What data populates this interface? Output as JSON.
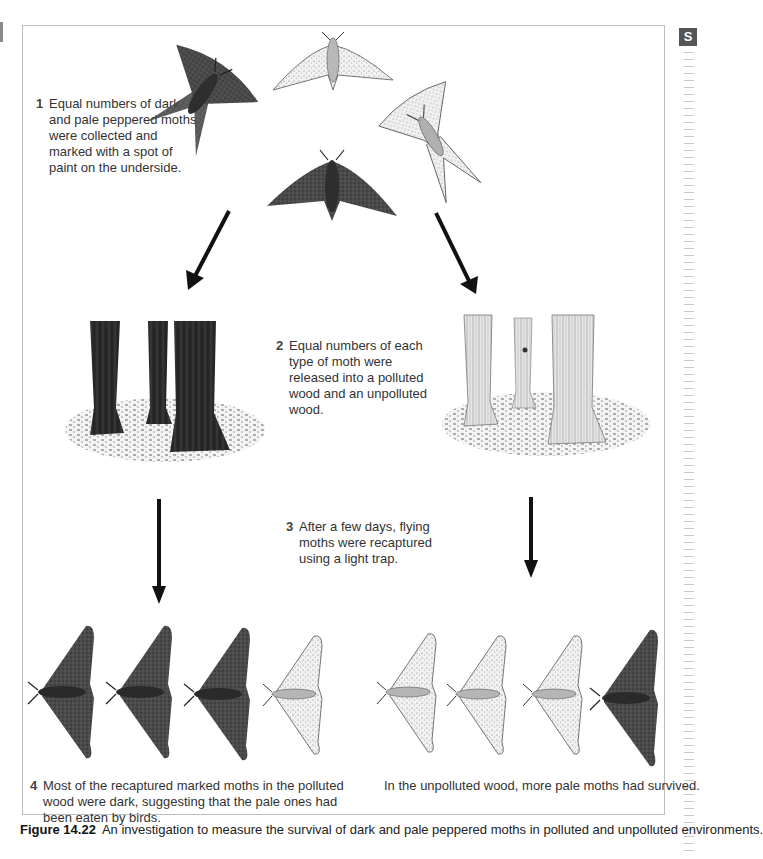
{
  "page": {
    "side_tab_letter": "S"
  },
  "figure": {
    "number": "Figure 14.22",
    "caption": "An investigation to measure the survival of dark and pale peppered moths in polluted and unpolluted environments.",
    "steps": [
      {
        "number": "1",
        "text_lines": [
          "Equal numbers of dark",
          "and pale peppered moths",
          "were collected and",
          "marked with a spot of",
          "paint on the underside."
        ]
      },
      {
        "number": "2",
        "text_lines": [
          "Equal numbers of each",
          "type of moth were",
          "released into a polluted",
          "wood and an unpolluted",
          "wood."
        ]
      },
      {
        "number": "3",
        "text_lines": [
          "After a few days, flying",
          "moths were recaptured",
          "using a light trap."
        ]
      },
      {
        "number": "4",
        "text_lines": [
          "Most of the recaptured marked moths in the polluted",
          "wood were dark, suggesting that the pale ones had",
          "been eaten by birds."
        ]
      }
    ],
    "unpolluted_result": "In the unpolluted wood, more pale moths had survived.",
    "illustrations": {
      "initial_moths": [
        "dark",
        "pale",
        "pale",
        "dark"
      ],
      "polluted_wood": "dark-tree-trunks",
      "unpolluted_wood": "pale-tree-trunks",
      "polluted_recaptured": [
        "dark",
        "dark",
        "dark",
        "pale"
      ],
      "unpolluted_recaptured": [
        "pale",
        "pale",
        "pale",
        "dark"
      ]
    },
    "colors": {
      "dark_moth": "#3a3a3a",
      "pale_moth": "#e9e9e9",
      "frame_border": "#bdbdbd",
      "arrow": "#111111"
    }
  }
}
